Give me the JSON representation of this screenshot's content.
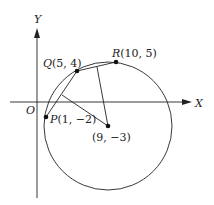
{
  "axes": {
    "x_label": "X",
    "y_label": "Y",
    "origin_label": "O"
  },
  "points": {
    "P": {
      "label": "P(1, −2)",
      "name": "P",
      "coords": "(1, −2)"
    },
    "Q": {
      "label": "Q(5, 4)",
      "name": "Q",
      "coords": "(5, 4)"
    },
    "R": {
      "label": "R(10, 5)",
      "name": "R",
      "coords": "(10, 5)"
    },
    "center": {
      "label": "(9, −3)"
    }
  },
  "colors": {
    "stroke": "#222222",
    "background": "#ffffff"
  }
}
